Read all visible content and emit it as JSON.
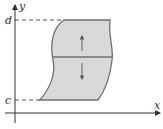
{
  "diagram": {
    "axes": {
      "x_label": "x",
      "y_label": "y"
    },
    "bounds": {
      "lower_label": "c",
      "upper_label": "d"
    },
    "colors": {
      "region_fill": "#d9d9d9",
      "region_stroke": "#707070",
      "axis": "#333333"
    }
  }
}
